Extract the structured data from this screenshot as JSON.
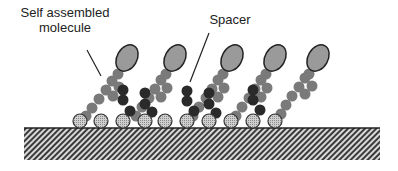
{
  "labels": {
    "self_assembled_molecule_line1": "Self assembled",
    "self_assembled_molecule_line2": "molecule",
    "spacer": "Spacer"
  },
  "colors": {
    "background": "#ffffff",
    "head_fill": "#9a9a9a",
    "head_stroke": "#222222",
    "chain_bead": "#7a7a7a",
    "spacer_bead": "#2a2a2a",
    "anchor_fill": "#bdbdbd",
    "substrate_hatch_dark": "#3a3a3a",
    "substrate_hatch_light": "#d8d8d8",
    "text": "#222222"
  },
  "diagram": {
    "substrate": {
      "x": 24,
      "y": 128,
      "width": 356,
      "height": 32
    },
    "anchor_radius": 7,
    "anchors_x": [
      80,
      101,
      123,
      145,
      165,
      187,
      209,
      231,
      253,
      275
    ],
    "anchor_y": 121,
    "molecules": [
      {
        "head": [
          127,
          58
        ],
        "beads": [
          [
            112,
            81
          ],
          [
            106,
            90
          ],
          [
            99,
            99
          ],
          [
            92,
            108
          ],
          [
            86,
            116
          ],
          [
            119,
            87
          ],
          [
            113,
            96
          ]
        ]
      },
      {
        "head": [
          175,
          58
        ],
        "beads": [
          [
            161,
            80
          ],
          [
            155,
            89
          ],
          [
            149,
            98
          ],
          [
            142,
            107
          ],
          [
            136,
            116
          ],
          [
            167,
            88
          ],
          [
            161,
            97
          ]
        ]
      },
      {
        "head": [
          232,
          58
        ],
        "beads": [
          [
            218,
            80
          ],
          [
            212,
            89
          ],
          [
            206,
            98
          ],
          [
            199,
            107
          ],
          [
            193,
            116
          ],
          [
            224,
            88
          ],
          [
            218,
            97
          ]
        ]
      },
      {
        "head": [
          275,
          58
        ],
        "beads": [
          [
            261,
            80
          ],
          [
            255,
            89
          ],
          [
            249,
            98
          ],
          [
            242,
            107
          ],
          [
            236,
            116
          ],
          [
            267,
            88
          ],
          [
            261,
            97
          ]
        ]
      },
      {
        "head": [
          318,
          58
        ],
        "beads": [
          [
            305,
            78
          ],
          [
            299,
            87
          ],
          [
            292,
            96
          ],
          [
            286,
            105
          ],
          [
            281,
            114
          ],
          [
            312,
            86
          ],
          [
            305,
            94
          ]
        ]
      }
    ],
    "spacers": [
      {
        "beads": [
          [
            123,
            100
          ],
          [
            123,
            90
          ],
          [
            130,
            111
          ]
        ]
      },
      {
        "beads": [
          [
            145,
            104
          ],
          [
            145,
            93
          ],
          [
            152,
            112
          ]
        ]
      },
      {
        "beads": [
          [
            187,
            101
          ],
          [
            187,
            91
          ],
          [
            194,
            111
          ]
        ]
      },
      {
        "beads": [
          [
            209,
            104
          ],
          [
            209,
            93
          ],
          [
            216,
            113
          ]
        ]
      },
      {
        "beads": [
          [
            253,
            100
          ],
          [
            253,
            90
          ],
          [
            260,
            110
          ]
        ]
      }
    ],
    "leader_lines": {
      "self_assembled": [
        [
          87,
          50
        ],
        [
          101,
          76
        ]
      ],
      "spacer": [
        [
          209,
          33
        ],
        [
          190,
          82
        ]
      ]
    }
  }
}
